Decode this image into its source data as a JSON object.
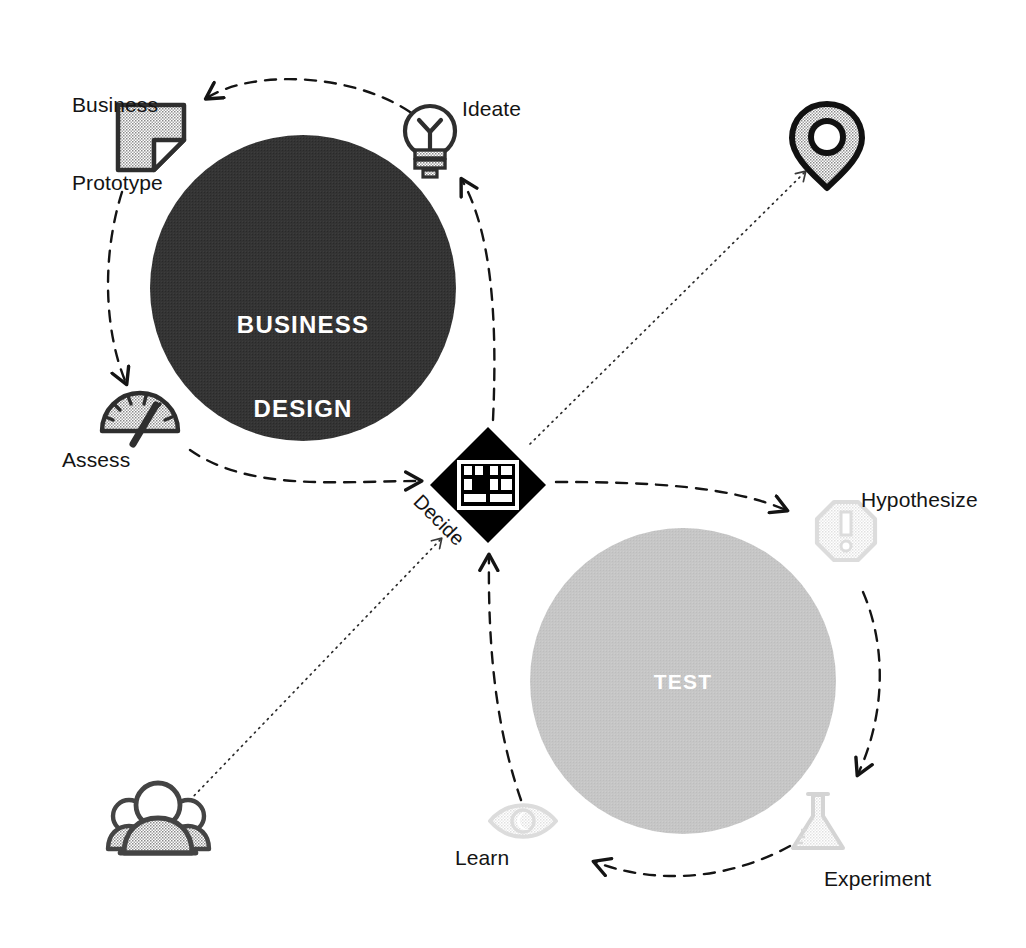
{
  "diagram": {
    "title_hidden": "",
    "colors": {
      "dark": "#333333",
      "light_gray": "#c4c4c4",
      "pale_gray": "#e6e6e6",
      "ink": "#141414",
      "white": "#ffffff",
      "icon_gray": "#555555"
    },
    "hubs": [
      {
        "id": "business-design",
        "label": "BUSINESS\nDESIGN",
        "label_line1": "BUSINESS",
        "label_line2": "DESIGN",
        "fill": "#333333",
        "text_color": "#ffffff",
        "cx": 303,
        "cy": 288,
        "r": 153
      },
      {
        "id": "test",
        "label": "TEST",
        "label_line1": "TEST",
        "label_line2": "",
        "fill": "#c4c4c4",
        "text_color": "#ffffff",
        "cx": 683,
        "cy": 681,
        "r": 153
      }
    ],
    "center": {
      "id": "decide",
      "label": "Decide",
      "icon": "kanban-board-icon",
      "fill": "#000000",
      "cx": 488,
      "cy": 485,
      "half": 58
    },
    "nodes": [
      {
        "id": "business-prototype",
        "label": "Business\nPrototype",
        "label_line1": "Business",
        "label_line2": "Prototype",
        "icon": "document-folded-corner-icon",
        "tone": "dark",
        "x": 72,
        "y": 40
      },
      {
        "id": "ideate",
        "label": "Ideate",
        "icon": "lightbulb-icon",
        "tone": "dark",
        "x": 462,
        "y": 100
      },
      {
        "id": "assess",
        "label": "Assess",
        "icon": "gauge-icon",
        "tone": "dark",
        "x": 62,
        "y": 450
      },
      {
        "id": "hypothesize",
        "label": "Hypothesize",
        "icon": "octagon-exclamation-icon",
        "tone": "light",
        "x": 861,
        "y": 490
      },
      {
        "id": "experiment",
        "label": "Experiment",
        "icon": "flask-icon",
        "tone": "light",
        "x": 824,
        "y": 869
      },
      {
        "id": "learn",
        "label": "Learn",
        "icon": "eye-icon",
        "tone": "light",
        "x": 455,
        "y": 848
      }
    ],
    "external": [
      {
        "id": "location-pin",
        "icon": "map-pin-icon",
        "label": "",
        "tone": "dark",
        "cx": 827,
        "cy": 140
      },
      {
        "id": "people-group",
        "icon": "people-group-icon",
        "label": "",
        "tone": "dark",
        "cx": 158,
        "cy": 824
      }
    ],
    "connectors": [
      {
        "from": "ideate",
        "to": "business-prototype",
        "style": "dashed",
        "arrow": true
      },
      {
        "from": "business-prototype",
        "to": "assess",
        "style": "dashed",
        "arrow": true
      },
      {
        "from": "assess",
        "to": "decide",
        "style": "dashed",
        "arrow": true
      },
      {
        "from": "decide",
        "to": "ideate",
        "style": "dashed",
        "arrow": true
      },
      {
        "from": "decide",
        "to": "hypothesize",
        "style": "dashed",
        "arrow": true
      },
      {
        "from": "hypothesize",
        "to": "experiment",
        "style": "dashed",
        "arrow": true
      },
      {
        "from": "experiment",
        "to": "learn",
        "style": "dashed",
        "arrow": true
      },
      {
        "from": "learn",
        "to": "decide",
        "style": "dashed",
        "arrow": true
      },
      {
        "from": "decide",
        "to": "location-pin",
        "style": "dotted",
        "arrow": true
      },
      {
        "from": "people-group",
        "to": "decide",
        "style": "dotted",
        "arrow": true
      }
    ]
  }
}
